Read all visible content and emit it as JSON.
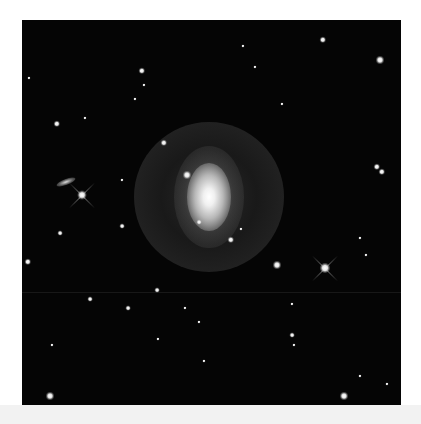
{
  "image": {
    "subject": "barred ring spiral galaxy",
    "background_color": "#ffffff",
    "sky_color": "#050505",
    "frame": {
      "x": 22,
      "y": 20,
      "width": 379,
      "height": 385
    }
  },
  "galaxy": {
    "center": {
      "x": 187,
      "y": 177
    },
    "core_rx": 22,
    "core_ry": 34,
    "ring_r": 75,
    "companion": {
      "x": 165,
      "y": 155,
      "size": 8
    }
  },
  "side_galaxy": {
    "x": 44,
    "y": 162,
    "w": 20,
    "h": 6,
    "angle": -20
  },
  "bright_stars_with_spikes": [
    {
      "x": 60,
      "y": 175,
      "size": 9
    },
    {
      "x": 303,
      "y": 248,
      "size": 10
    }
  ],
  "stars": [
    {
      "x": 301,
      "y": 20,
      "s": 4
    },
    {
      "x": 358,
      "y": 40,
      "s": 5
    },
    {
      "x": 120,
      "y": 51,
      "s": 4
    },
    {
      "x": 122,
      "y": 65,
      "s": 2
    },
    {
      "x": 221,
      "y": 26,
      "s": 2
    },
    {
      "x": 233,
      "y": 47,
      "s": 2
    },
    {
      "x": 35,
      "y": 104,
      "s": 4
    },
    {
      "x": 63,
      "y": 98,
      "s": 2
    },
    {
      "x": 113,
      "y": 79,
      "s": 2
    },
    {
      "x": 142,
      "y": 123,
      "s": 4
    },
    {
      "x": 355,
      "y": 147,
      "s": 4
    },
    {
      "x": 360,
      "y": 152,
      "s": 4
    },
    {
      "x": 100,
      "y": 160,
      "s": 2
    },
    {
      "x": 38,
      "y": 213,
      "s": 3
    },
    {
      "x": 100,
      "y": 206,
      "s": 3
    },
    {
      "x": 177,
      "y": 202,
      "s": 3
    },
    {
      "x": 209,
      "y": 220,
      "s": 4
    },
    {
      "x": 219,
      "y": 209,
      "s": 2
    },
    {
      "x": 255,
      "y": 245,
      "s": 5
    },
    {
      "x": 6,
      "y": 242,
      "s": 4
    },
    {
      "x": 338,
      "y": 218,
      "s": 2
    },
    {
      "x": 344,
      "y": 235,
      "s": 2
    },
    {
      "x": 135,
      "y": 270,
      "s": 3
    },
    {
      "x": 68,
      "y": 279,
      "s": 3
    },
    {
      "x": 106,
      "y": 288,
      "s": 3
    },
    {
      "x": 163,
      "y": 288,
      "s": 2
    },
    {
      "x": 270,
      "y": 284,
      "s": 2
    },
    {
      "x": 177,
      "y": 302,
      "s": 2
    },
    {
      "x": 270,
      "y": 315,
      "s": 3
    },
    {
      "x": 272,
      "y": 325,
      "s": 2
    },
    {
      "x": 30,
      "y": 325,
      "s": 2
    },
    {
      "x": 136,
      "y": 319,
      "s": 2
    },
    {
      "x": 182,
      "y": 341,
      "s": 2
    },
    {
      "x": 28,
      "y": 376,
      "s": 5
    },
    {
      "x": 322,
      "y": 376,
      "s": 5
    },
    {
      "x": 365,
      "y": 364,
      "s": 2
    },
    {
      "x": 338,
      "y": 356,
      "s": 2
    },
    {
      "x": 7,
      "y": 58,
      "s": 2
    },
    {
      "x": 260,
      "y": 84,
      "s": 2
    }
  ]
}
